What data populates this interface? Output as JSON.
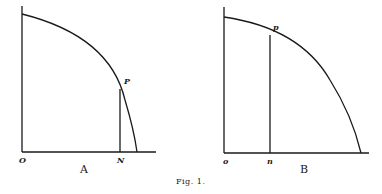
{
  "figure": {
    "caption": "Fig. 1.",
    "panels": [
      {
        "id": "A",
        "label": "A",
        "origin_label": "O",
        "foot_label": "N",
        "point_label": "P"
      },
      {
        "id": "B",
        "label": "B",
        "origin_label": "o",
        "foot_label": "n",
        "point_label": "p"
      }
    ]
  },
  "colors": {
    "ink": "#1a1a1a",
    "background": "#ffffff"
  }
}
